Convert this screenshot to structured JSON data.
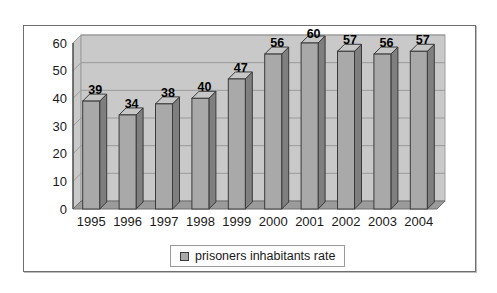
{
  "chart_data": {
    "type": "bar",
    "style": "3d-column",
    "title": "",
    "xlabel": "",
    "ylabel": "",
    "categories": [
      "1995",
      "1996",
      "1997",
      "1998",
      "1999",
      "2000",
      "2001",
      "2002",
      "2003",
      "2004"
    ],
    "series": [
      {
        "name": "prisoners inhabitants rate",
        "values": [
          39,
          34,
          38,
          40,
          47,
          56,
          60,
          57,
          56,
          57
        ]
      }
    ],
    "ylim": [
      0,
      60
    ],
    "ytick_step": 10,
    "yticks": [
      0,
      10,
      20,
      30,
      40,
      50,
      60
    ],
    "grid": true,
    "data_labels": true,
    "legend_position": "bottom"
  },
  "colors": {
    "background": "#ffffff",
    "frame_border": "#6e6e6e",
    "wall": "#c9c9c9",
    "wall_edge": "#9e9e9e",
    "gridline": "#9a9a9a",
    "floor": "#9b9b9b",
    "floor_edge": "#6f6f6f",
    "axis_line": "#3c3c3c",
    "bar_front": "#a9a9a9",
    "bar_side": "#7f7f7f",
    "bar_top": "#c6c6c6",
    "bar_outline": "#3a3a3a",
    "axis_text": "#1a1a1a",
    "value_label": "#000000"
  }
}
